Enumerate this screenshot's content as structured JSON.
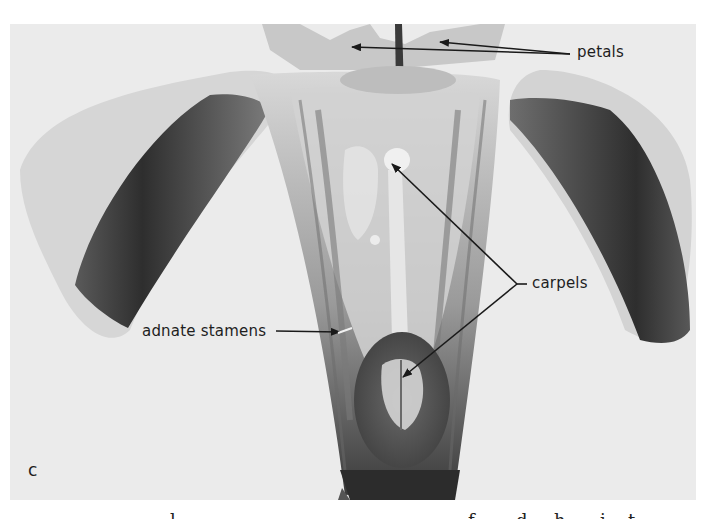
{
  "figure": {
    "panel_letter": "c",
    "labels": {
      "petals": "petals",
      "carpels": "carpels",
      "adnate_stamens": "adnate stamens"
    },
    "caption_partial": "(caption text cut off at bottom edge; only ascenders visible)",
    "colors": {
      "background": "#ebebeb",
      "page": "#ffffff",
      "dark_petal": "#3c3c3c",
      "label_text": "#1e1e1e"
    }
  }
}
